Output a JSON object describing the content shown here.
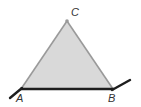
{
  "diagram": {
    "type": "geometry-triangle",
    "vertices": [
      {
        "name": "A",
        "label": "A"
      },
      {
        "name": "B",
        "label": "B"
      },
      {
        "name": "C",
        "label": "C"
      }
    ],
    "colors": {
      "fill": "#d9d9d9",
      "sides": "#9a9a9a",
      "base": "#1e1e1e",
      "extensions": "#1e1e1e",
      "labels": "#333333"
    }
  }
}
